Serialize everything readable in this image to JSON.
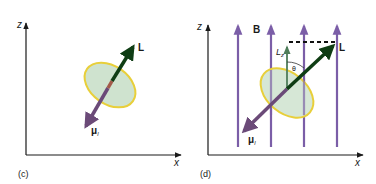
{
  "panels": [
    {
      "id": "c",
      "caption": "(c)",
      "axes": {
        "vertical_label": "z",
        "horizontal_label": "x"
      },
      "vectors": [
        {
          "name": "angular-momentum",
          "label": "L",
          "color": "#0f3d14"
        },
        {
          "name": "magnetic-moment",
          "label": "μ",
          "subscript": "l",
          "color": "#6b4a78"
        }
      ],
      "orbit": {
        "fill": "#cfe3cf",
        "stroke": "#e8cf3a"
      }
    },
    {
      "id": "d",
      "caption": "(d)",
      "axes": {
        "vertical_label": "z",
        "horizontal_label": "x"
      },
      "field": {
        "label": "B",
        "color": "#7b5ea7",
        "line_count": 4
      },
      "vectors": [
        {
          "name": "angular-momentum",
          "label": "L",
          "color": "#0f3d14"
        },
        {
          "name": "magnetic-moment",
          "label": "μ",
          "subscript": "l",
          "color": "#6b4a78"
        },
        {
          "name": "z-component",
          "label": "L",
          "subscript": "z",
          "color": "#4f7d5a"
        }
      ],
      "angle_label": "θ",
      "orbit": {
        "fill": "#cfe3cf",
        "stroke": "#e8cf3a"
      }
    }
  ]
}
